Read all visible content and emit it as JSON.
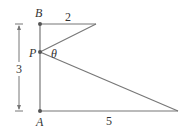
{
  "diagram": {
    "points": {
      "B": {
        "label": "B"
      },
      "P": {
        "label": "P"
      },
      "A": {
        "label": "A"
      }
    },
    "angle_label": "θ",
    "lengths": {
      "top": "2",
      "bottom": "5",
      "vertical": "3"
    },
    "colors": {
      "line": "#777777",
      "text": "#333333"
    }
  }
}
